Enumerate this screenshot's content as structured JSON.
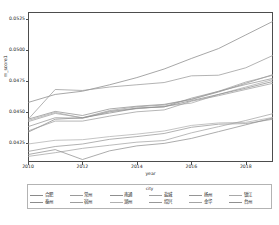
{
  "chart_data": {
    "type": "line",
    "title": "",
    "xlabel": "year",
    "ylabel": "m_score1",
    "xlim": [
      2010,
      2019
    ],
    "ylim": [
      0.04095,
      0.05305
    ],
    "grid": false,
    "legend_position": "bottom",
    "legend_title": "city",
    "xticks": [
      2010,
      2012,
      2014,
      2016,
      2018
    ],
    "xtick_labels": [
      "2010",
      "2012",
      "2014",
      "2016",
      "2018"
    ],
    "yticks": [
      0.0425,
      0.045,
      0.0475,
      0.05,
      0.0525
    ],
    "ytick_labels": [
      "0.0425",
      "0.0450",
      "0.0475",
      "0.0500",
      "0.0525"
    ],
    "x": [
      2010,
      2011,
      2012,
      2013,
      2014,
      2015,
      2016,
      2017,
      2018,
      2019
    ],
    "series": [
      {
        "name": "合肥",
        "color": "#8a8a8a",
        "values": [
          0.04575,
          0.0464,
          0.04666,
          0.04718,
          0.04776,
          0.04845,
          0.0493,
          0.0501,
          0.0512,
          0.0523
        ]
      },
      {
        "name": "常州",
        "color": "#9a9a9a",
        "values": [
          0.04438,
          0.0468,
          0.04672,
          0.047,
          0.04718,
          0.04736,
          0.0479,
          0.04795,
          0.04855,
          0.04955
        ]
      },
      {
        "name": "南通",
        "color": "#8f8f8f",
        "values": [
          0.0444,
          0.04503,
          0.0447,
          0.04523,
          0.04545,
          0.0456,
          0.046,
          0.0466,
          0.0473,
          0.048
        ]
      },
      {
        "name": "盐城",
        "color": "#a0a0a0",
        "values": [
          0.0442,
          0.04487,
          0.04452,
          0.0451,
          0.0454,
          0.04555,
          0.046,
          0.04665,
          0.0474,
          0.04795
        ]
      },
      {
        "name": "扬州",
        "color": "#959595",
        "values": [
          0.0438,
          0.04452,
          0.04448,
          0.045,
          0.0453,
          0.0454,
          0.0461,
          0.04665,
          0.0472,
          0.0477
        ]
      },
      {
        "name": "镇江",
        "color": "#a8a8a8",
        "values": [
          0.0443,
          0.04495,
          0.0445,
          0.04505,
          0.04525,
          0.04545,
          0.0457,
          0.0464,
          0.047,
          0.0476
        ]
      },
      {
        "name": "泰州",
        "color": "#8c8c8c",
        "values": [
          0.04335,
          0.0444,
          0.04452,
          0.0449,
          0.04528,
          0.0454,
          0.0459,
          0.0464,
          0.0469,
          0.04745
        ]
      },
      {
        "name": "宿州",
        "color": "#9d9d9d",
        "values": [
          0.04345,
          0.04425,
          0.04425,
          0.04465,
          0.045,
          0.04515,
          0.04585,
          0.0463,
          0.0468,
          0.0473
        ]
      },
      {
        "name": "湖州",
        "color": "#b0b0b0",
        "values": [
          0.0424,
          0.0427,
          0.04275,
          0.043,
          0.0432,
          0.04345,
          0.0439,
          0.0441,
          0.04415,
          0.04455
        ]
      },
      {
        "name": "绍兴",
        "color": "#989898",
        "values": [
          0.0418,
          0.0422,
          0.0424,
          0.04278,
          0.043,
          0.04325,
          0.04375,
          0.044,
          0.04405,
          0.0444
        ]
      },
      {
        "name": "金华",
        "color": "#a4a4a4",
        "values": [
          0.0414,
          0.0417,
          0.04205,
          0.0423,
          0.04255,
          0.04268,
          0.0433,
          0.0438,
          0.0443,
          0.04485
        ]
      },
      {
        "name": "台州",
        "color": "#909090",
        "values": [
          0.04155,
          0.04195,
          0.04115,
          0.04185,
          0.04225,
          0.04245,
          0.04285,
          0.0434,
          0.04395,
          0.0445
        ]
      }
    ]
  },
  "legend": {
    "title": "city",
    "rows": [
      [
        "合肥",
        "常州",
        "南通",
        "盐城",
        "扬州",
        "镇江"
      ],
      [
        "泰州",
        "宿州",
        "湖州",
        "绍兴",
        "金华",
        "台州"
      ]
    ]
  },
  "axes": {
    "x_title": "year",
    "y_title": "m_score1"
  }
}
